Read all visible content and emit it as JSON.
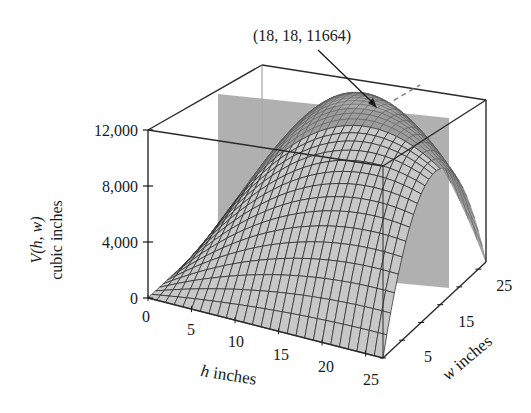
{
  "chart_data": {
    "type": "surface3d",
    "function": "V(h, w) = h * w * (108 - 2h - 2w)  [maximum at (18, 18)]",
    "zlabel_line1": "V(h, w)",
    "zlabel_line2": "cubic inches",
    "xlabel_var": "h",
    "xlabel_unit": " inches",
    "ylabel_var": "w",
    "ylabel_unit": " inches",
    "x_ticks": [
      "0",
      "5",
      "10",
      "15",
      "20",
      "25"
    ],
    "y_ticks": [
      "5",
      "15",
      "25"
    ],
    "z_ticks": [
      "0",
      "4,000",
      "8,000",
      "12,000"
    ],
    "xlim": [
      0,
      27
    ],
    "ylim": [
      0,
      27
    ],
    "zlim": [
      0,
      12000
    ],
    "annotation": {
      "text": "(18, 18, 11664)",
      "point": {
        "h": 18,
        "w": 18,
        "V": 11664
      }
    },
    "cutting_plane": {
      "description": "gray vertical plane through the maximum",
      "color": "#a9a9a9"
    },
    "colors": {
      "surface_front": "#c8c8c8",
      "surface_back": "#9a9a9a",
      "mesh": "#222222",
      "box": "#2a2a2a"
    }
  }
}
